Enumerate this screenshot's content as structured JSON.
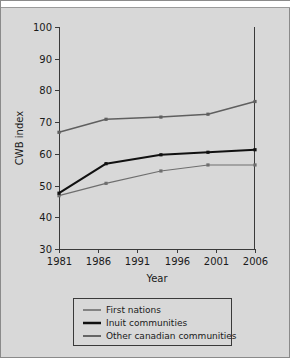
{
  "chart_data": {
    "type": "line",
    "title": "",
    "xlabel": "Year",
    "ylabel": "CWB index",
    "xlim": [
      1981,
      2006
    ],
    "ylim": [
      30,
      100
    ],
    "xticks": [
      1981,
      1986,
      1991,
      1996,
      2001,
      2006
    ],
    "yticks": [
      30,
      40,
      50,
      60,
      70,
      80,
      90,
      100
    ],
    "grid": false,
    "legend_position": "bottom",
    "x": [
      1981,
      1987,
      1994,
      2000,
      2006
    ],
    "series": [
      {
        "name": "First nations",
        "color": "#6e6e6e",
        "width": 1.2,
        "values": [
          46.8,
          50.7,
          54.6,
          56.5,
          56.5
        ]
      },
      {
        "name": "Inuit communities",
        "color": "#111111",
        "width": 2.1,
        "values": [
          47.6,
          56.9,
          59.7,
          60.5,
          61.3
        ]
      },
      {
        "name": "Other canadian communities",
        "color": "#5f5f5f",
        "width": 1.5,
        "values": [
          66.8,
          70.9,
          71.6,
          72.5,
          76.5
        ]
      }
    ]
  },
  "legend": {
    "entries": [
      {
        "label": "First nations"
      },
      {
        "label": "Inuit communities"
      },
      {
        "label": "Other canadian communities"
      }
    ]
  }
}
